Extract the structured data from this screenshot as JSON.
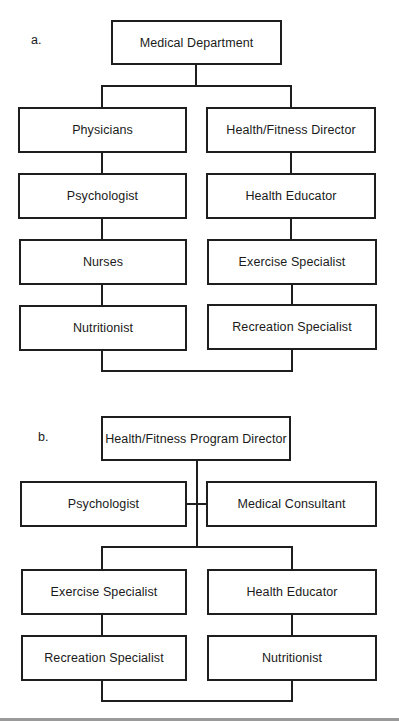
{
  "diagram": {
    "type": "org-chart",
    "panels": [
      {
        "label": "a.",
        "root": "Medical Department",
        "left_column": [
          "Physicians",
          "Psychologist",
          "Nurses",
          "Nutritionist"
        ],
        "right_column": [
          "Health/Fitness Director",
          "Health Educator",
          "Exercise Specialist",
          "Recreation Specialist"
        ]
      },
      {
        "label": "b.",
        "root": "Health/Fitness Program Director",
        "staff_left": "Psychologist",
        "staff_right": "Medical Consultant",
        "left_column": [
          "Exercise Specialist",
          "Recreation Specialist"
        ],
        "right_column": [
          "Health Educator",
          "Nutritionist"
        ]
      }
    ]
  }
}
